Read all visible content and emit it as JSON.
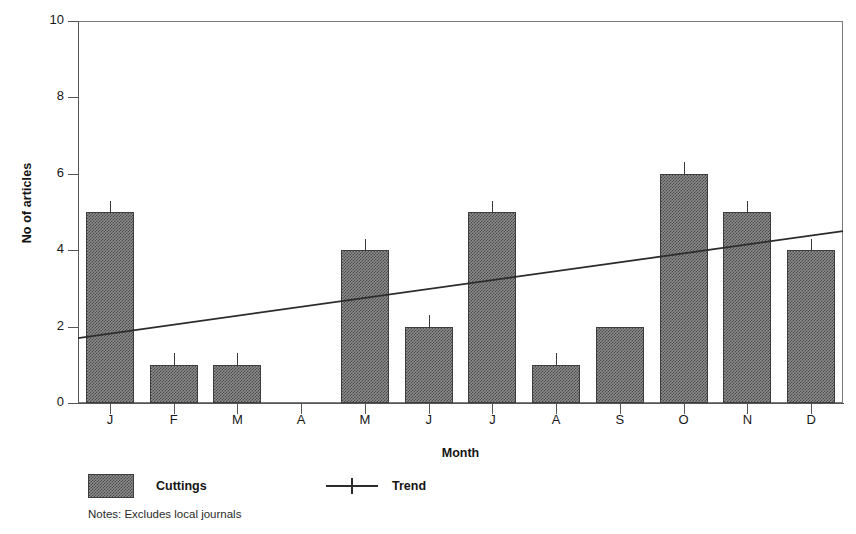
{
  "chart_data": {
    "type": "bar",
    "title": "",
    "xlabel": "Month",
    "ylabel": "No of articles",
    "categories": [
      "J",
      "F",
      "M",
      "A",
      "M",
      "J",
      "J",
      "A",
      "S",
      "O",
      "N",
      "D"
    ],
    "series": [
      {
        "name": "Cuttings",
        "type": "bar",
        "values": [
          5,
          1,
          1,
          0,
          4,
          2,
          5,
          1,
          2,
          6,
          5,
          4
        ],
        "errors": [
          0.3,
          0.3,
          0.3,
          0,
          0.3,
          0.3,
          0.3,
          0.3,
          0,
          0.3,
          0.3,
          0.3
        ]
      },
      {
        "name": "Trend",
        "type": "line",
        "x": [
          "J",
          "D"
        ],
        "values": [
          1.7,
          4.5
        ]
      }
    ],
    "ylim": [
      0,
      10
    ],
    "yticks": [
      0,
      2,
      4,
      6,
      8,
      10
    ],
    "ytick_labels": [
      "0",
      "2",
      "4",
      "6",
      "8",
      "10"
    ],
    "grid": false,
    "legend_position": "below-left",
    "annotations": [
      "Notes: Excludes local journals"
    ]
  },
  "axes": {
    "y_title": "No of articles",
    "x_title": "Month"
  },
  "legend": {
    "items": [
      {
        "label": "Cuttings",
        "marker": "filled-swatch"
      },
      {
        "label": "Trend",
        "marker": "line-cross"
      }
    ]
  },
  "notes": {
    "text": "Notes: Excludes local journals"
  },
  "colors": {
    "bar_fill": "#8d8d8d",
    "bar_outline": "#3d3d3d",
    "trend_line": "#2c2c2c",
    "axis": "#555555",
    "text": "#141414"
  }
}
